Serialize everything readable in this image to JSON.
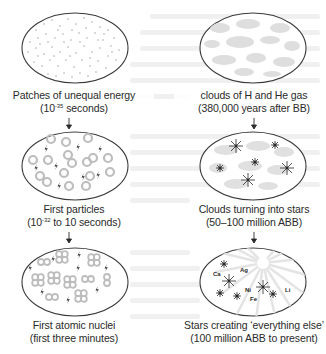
{
  "diagram": {
    "title": "",
    "colors": {
      "outline": "#3a3a3a",
      "fill_gray": "#c8c8c8",
      "light_gray": "#dcdcdc",
      "star": "#2a2a2a",
      "text": "#2a2a2a"
    },
    "stages": [
      {
        "id": "patches",
        "column": "left",
        "order": 1,
        "title": "Patches of unequal energy",
        "time_prefix": "(10",
        "time_exp": "-35",
        "time_suffix": " seconds)",
        "illustration": "dotted-speckles"
      },
      {
        "id": "particles",
        "column": "left",
        "order": 2,
        "title": "First particles",
        "time_prefix": "(10",
        "time_exp": "-32",
        "time_suffix": " to 10 seconds)",
        "illustration": "rings-and-lightning"
      },
      {
        "id": "nuclei",
        "column": "left",
        "order": 3,
        "title": "First atomic nuclei",
        "time": "(first three minutes)",
        "illustration": "nuclei-clusters-and-lightning"
      },
      {
        "id": "gas-clouds",
        "column": "right",
        "order": 4,
        "title": "clouds of H and He gas",
        "time": "(380,000 years after BB)",
        "illustration": "gray-clouds"
      },
      {
        "id": "stars-forming",
        "column": "right",
        "order": 5,
        "title": "Clouds turning into stars",
        "time": "(50–100 million ABB)",
        "illustration": "clouds-with-stars"
      },
      {
        "id": "everything-else",
        "column": "right",
        "order": 6,
        "title": "Stars creating ‘everything else’",
        "time": "(100 million ABB to present)",
        "illustration": "radiating-stars-with-elements",
        "elements": [
          "Ca",
          "Ag",
          "Ni",
          "Fe",
          "Li"
        ]
      }
    ],
    "arrows": [
      {
        "from": "patches",
        "to": "particles",
        "glyph": "↓"
      },
      {
        "from": "particles",
        "to": "nuclei",
        "glyph": "↓"
      },
      {
        "from": "gas-clouds",
        "to": "stars-forming",
        "glyph": "↓"
      },
      {
        "from": "stars-forming",
        "to": "everything-else",
        "glyph": "↓"
      }
    ]
  }
}
